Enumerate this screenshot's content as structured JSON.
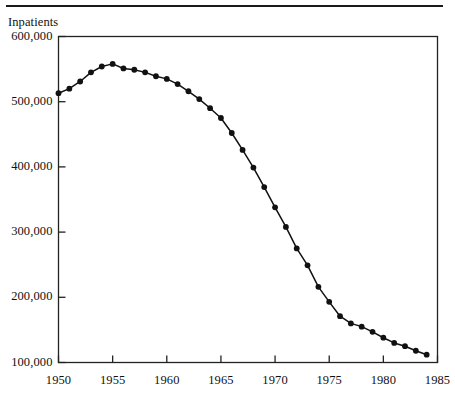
{
  "figure": {
    "rule_color": "#1a1a1a",
    "axis_color": "#222222",
    "series_color": "#111111",
    "background": "#ffffff"
  },
  "chart_data": {
    "type": "line",
    "title": "Inpatients",
    "xlabel": "",
    "ylabel": "Inpatients",
    "xlim": [
      1950,
      1985
    ],
    "ylim": [
      100000,
      600000
    ],
    "grid": false,
    "legend": null,
    "markers": "filled-circle",
    "xticks": [
      1950,
      1955,
      1960,
      1965,
      1970,
      1975,
      1980,
      1985
    ],
    "xtick_labels": [
      "1950",
      "1955",
      "1960",
      "1965",
      "1970",
      "1975",
      "1980",
      "1985"
    ],
    "yticks": [
      100000,
      200000,
      300000,
      400000,
      500000,
      600000
    ],
    "ytick_labels": [
      "100,000",
      "200,000",
      "300,000",
      "400,000",
      "500,000",
      "600,000"
    ],
    "x": [
      1950,
      1951,
      1952,
      1953,
      1954,
      1955,
      1956,
      1957,
      1958,
      1959,
      1960,
      1961,
      1962,
      1963,
      1964,
      1965,
      1966,
      1967,
      1968,
      1969,
      1970,
      1971,
      1972,
      1973,
      1974,
      1975,
      1976,
      1977,
      1978,
      1979,
      1980,
      1981,
      1982,
      1983,
      1984
    ],
    "values": [
      513000,
      520000,
      531000,
      545000,
      554000,
      558000,
      551000,
      549000,
      545000,
      539000,
      535000,
      527000,
      516000,
      504000,
      490000,
      475000,
      452000,
      426000,
      399000,
      369000,
      338000,
      308000,
      275000,
      249000,
      216000,
      193000,
      171000,
      160000,
      155000,
      147000,
      138000,
      130000,
      125000,
      118000,
      112000
    ]
  }
}
